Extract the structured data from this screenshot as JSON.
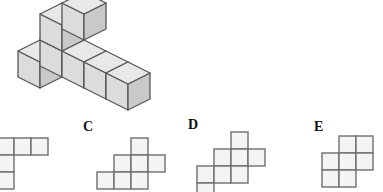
{
  "page": {
    "kind": "spatial-reasoning-question",
    "background_color": "#ffffff",
    "width": 383,
    "height": 192
  },
  "figure": {
    "name": "isometric-cube-assembly",
    "cube_count": 7,
    "colors": {
      "top_face": "#e8e8e8",
      "left_face": "#dcdcdc",
      "right_face": "#c9c9c9",
      "outline": "#565656"
    },
    "origin": {
      "x": 40,
      "y": 88
    },
    "cube_size": {
      "half_width": 22,
      "half_height": 11,
      "height": 26
    },
    "cubes": [
      {
        "id": "c1",
        "x": 0,
        "y": 0,
        "z": 0
      },
      {
        "id": "c2",
        "x": 1,
        "y": 0,
        "z": 0
      },
      {
        "id": "c3",
        "x": 1,
        "y": 1,
        "z": 0
      },
      {
        "id": "c4",
        "x": 1,
        "y": 2,
        "z": 0
      },
      {
        "id": "c5",
        "x": 1,
        "y": 3,
        "z": 0
      },
      {
        "id": "c6",
        "x": 1,
        "y": 0,
        "z": 1
      },
      {
        "id": "c7",
        "x": 2,
        "y": 0,
        "z": 1
      }
    ]
  },
  "options": {
    "grid": {
      "cell": 17,
      "fill": "#f4f4f4",
      "stroke": "#6e6e6e",
      "stroke_width": 1.4
    },
    "items": [
      {
        "label": "",
        "name": "option-b",
        "clipped": true,
        "label_x": 0,
        "label_y": 0,
        "origin_x": -20,
        "origin_y": 138,
        "cells": [
          [
            0,
            0
          ],
          [
            1,
            0
          ],
          [
            2,
            0
          ],
          [
            3,
            0
          ],
          [
            1,
            1
          ],
          [
            1,
            2
          ]
        ]
      },
      {
        "label": "C",
        "name": "option-c",
        "clipped": false,
        "label_x": 83,
        "label_y": 120,
        "origin_x": 97,
        "origin_y": 138,
        "cells": [
          [
            2,
            0
          ],
          [
            1,
            1
          ],
          [
            2,
            1
          ],
          [
            3,
            1
          ],
          [
            0,
            2
          ],
          [
            1,
            2
          ],
          [
            2,
            2
          ]
        ]
      },
      {
        "label": "D",
        "name": "option-d",
        "clipped": false,
        "label_x": 188,
        "label_y": 118,
        "origin_x": 197,
        "origin_y": 132,
        "cells": [
          [
            2,
            0
          ],
          [
            1,
            1
          ],
          [
            2,
            1
          ],
          [
            3,
            1
          ],
          [
            0,
            2
          ],
          [
            1,
            2
          ],
          [
            2,
            2
          ],
          [
            0,
            3
          ]
        ]
      },
      {
        "label": "E",
        "name": "option-e",
        "clipped": false,
        "label_x": 314,
        "label_y": 120,
        "origin_x": 322,
        "origin_y": 136,
        "cells": [
          [
            1,
            0
          ],
          [
            2,
            0
          ],
          [
            0,
            1
          ],
          [
            1,
            1
          ],
          [
            2,
            1
          ],
          [
            0,
            2
          ],
          [
            1,
            2
          ]
        ]
      }
    ]
  }
}
